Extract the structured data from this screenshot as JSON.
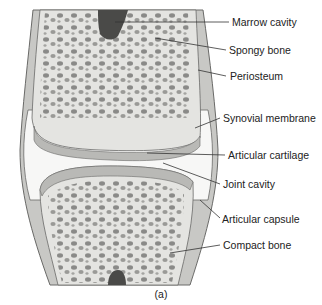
{
  "figure": {
    "caption": "(a)",
    "colors": {
      "bone_fill": "#e4e4e1",
      "pore_fill": "#8a8a88",
      "marrow": "#4a4a48",
      "cartilage": "#b9b9b6",
      "capsule": "#c8c8c5",
      "outline": "#6a6a68",
      "leader_line": "#333333",
      "text": "#222222"
    }
  },
  "labels": [
    {
      "id": "marrow-cavity",
      "text": "Marrow cavity",
      "x": 232,
      "y": 16,
      "line": [
        115,
        22,
        229,
        22
      ]
    },
    {
      "id": "spongy-bone",
      "text": "Spongy bone",
      "x": 229,
      "y": 44,
      "line": [
        155,
        38,
        226,
        50
      ]
    },
    {
      "id": "periosteum",
      "text": "Periosteum",
      "x": 230,
      "y": 70,
      "line": [
        198,
        70,
        226,
        76
      ]
    },
    {
      "id": "synovial-membrane",
      "text": "Synovial membrane",
      "x": 223,
      "y": 112,
      "line": [
        195,
        128,
        220,
        118
      ]
    },
    {
      "id": "articular-cartilage",
      "text": "Articular cartilage",
      "x": 228,
      "y": 149,
      "line": [
        147,
        153,
        225,
        155
      ]
    },
    {
      "id": "joint-cavity",
      "text": "Joint cavity",
      "x": 223,
      "y": 178,
      "line": [
        163,
        163,
        220,
        184
      ]
    },
    {
      "id": "articular-capsule",
      "text": "Articular capsule",
      "x": 222,
      "y": 213,
      "line": [
        200,
        200,
        220,
        218
      ]
    },
    {
      "id": "compact-bone",
      "text": "Compact bone",
      "x": 223,
      "y": 239,
      "line": [
        170,
        253,
        220,
        245
      ]
    }
  ]
}
